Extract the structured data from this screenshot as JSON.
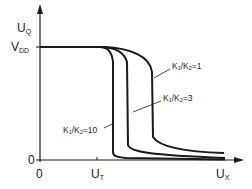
{
  "diagram": {
    "y_axis": {
      "label_main": "U",
      "label_sub": "Q",
      "tick_vdd_main": "V",
      "tick_vdd_sub": "DD",
      "tick_zero": "0"
    },
    "x_axis": {
      "label_main": "U",
      "label_sub": "X",
      "tick_zero": "0",
      "tick_ut_main": "U",
      "tick_ut_sub": "T"
    },
    "curves": [
      {
        "label_a": "K",
        "sub_a": "1",
        "slash": "/",
        "label_b": "K",
        "sub_b": "2",
        "eq": "=1"
      },
      {
        "label_a": "K",
        "sub_a": "1",
        "slash": "/",
        "label_b": "K",
        "sub_b": "2",
        "eq": "=3"
      },
      {
        "label_a": "K",
        "sub_a": "1",
        "slash": "/",
        "label_b": "K",
        "sub_b": "2",
        "eq": "=10"
      }
    ],
    "colors": {
      "line": "#1a1a1a",
      "background": "#ffffff"
    }
  }
}
